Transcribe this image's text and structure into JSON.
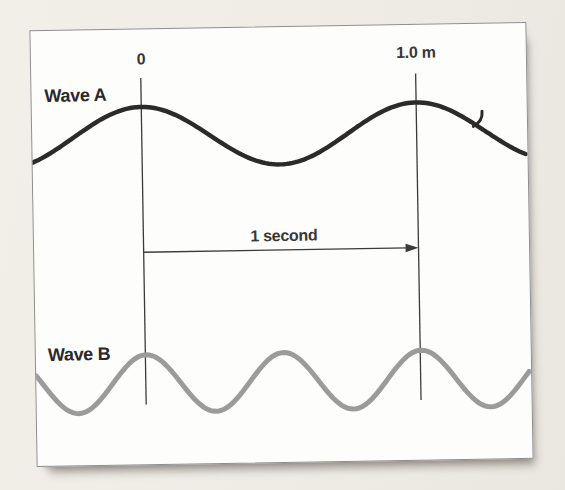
{
  "figure": {
    "wave_a_label": "Wave A",
    "wave_b_label": "Wave B",
    "marker_zero_label": "0",
    "marker_distance_label": "1.0 m",
    "interval_label": "1 second"
  },
  "colors": {
    "page_background": "#f0ede7",
    "frame_background": "#fdfdfc",
    "frame_border": "#8e8e8e",
    "wave_a_stroke": "#2d2a2a",
    "wave_b_stroke": "#9b9b9b",
    "marker_line": "#3a3a3a",
    "text": "#2b2828"
  },
  "chart_data": {
    "type": "line",
    "title": "",
    "x_markers": [
      {
        "label": "0",
        "x_px": 110
      },
      {
        "label": "1.0 m",
        "x_px": 386
      }
    ],
    "interval": {
      "label": "1 second",
      "from_marker": "0",
      "to_marker": "1.0 m"
    },
    "series": [
      {
        "name": "Wave A",
        "color": "#2d2a2a",
        "cycles_between_markers": 1,
        "wavelength_m": 1.0
      },
      {
        "name": "Wave B",
        "color": "#9b9b9b",
        "cycles_between_markers": 2,
        "wavelength_m": 0.5
      }
    ],
    "layout": {
      "frame": {
        "left": 33,
        "top": 26,
        "width": 497,
        "height": 437,
        "rotate_deg": -0.95
      },
      "marker_line": {
        "y1": 49,
        "y2": 377,
        "stroke_width": 1.3
      },
      "arrow": {
        "y": 224,
        "head_length": 13,
        "head_half_width": 4.3,
        "stroke_width": 1.3
      },
      "wave_a": {
        "midline_y": 108,
        "amplitude": 30,
        "wavelength_px": 276,
        "crest_x": 110,
        "stroke_width": 4.5
      },
      "wave_b": {
        "midline_y": 356,
        "amplitude": 29,
        "wavelength_px": 138,
        "crest_x": 111,
        "stroke_width": 5
      }
    }
  }
}
